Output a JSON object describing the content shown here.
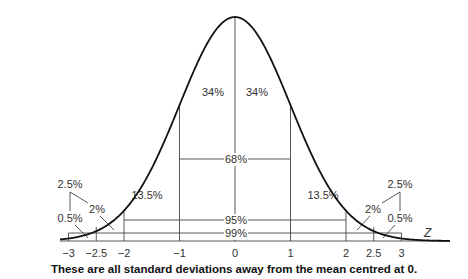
{
  "chart_data": {
    "type": "line",
    "title": "",
    "caption": "These are all standard deviations away from the mean centred at 0.",
    "xlabel": "Z",
    "ylabel": "",
    "x_range": [
      -3.3,
      4.2
    ],
    "curve": "standard normal density",
    "x_ticks": [
      {
        "value": -3,
        "label": "−3"
      },
      {
        "value": -2.5,
        "label": "−2.5"
      },
      {
        "value": -2,
        "label": "−2"
      },
      {
        "value": -1,
        "label": "−1"
      },
      {
        "value": 0,
        "label": "0"
      },
      {
        "value": 1,
        "label": "1"
      },
      {
        "value": 2,
        "label": "2"
      },
      {
        "value": 2.5,
        "label": "2.5"
      },
      {
        "value": 3,
        "label": "3"
      }
    ],
    "spans": [
      {
        "from": -1,
        "to": 1,
        "label": "68%"
      },
      {
        "from": -2,
        "to": 2,
        "label": "95%"
      },
      {
        "from": -3,
        "to": 3,
        "label": "99%"
      }
    ],
    "region_labels": [
      {
        "label": "34%",
        "region": "-1 to 0"
      },
      {
        "label": "34%",
        "region": "0 to 1"
      },
      {
        "label": "13.5%",
        "region": "-2 to -1"
      },
      {
        "label": "13.5%",
        "region": "1 to 2"
      },
      {
        "label": "2%",
        "region": "-2.5 to -2"
      },
      {
        "label": "2%",
        "region": "2 to 2.5"
      },
      {
        "label": "0.5%",
        "region": "-3 to -2.5"
      },
      {
        "label": "0.5%",
        "region": "2.5 to 3"
      },
      {
        "label": "2.5%",
        "region": "left tail beyond -2"
      },
      {
        "label": "2.5%",
        "region": "right tail beyond 2"
      }
    ]
  }
}
